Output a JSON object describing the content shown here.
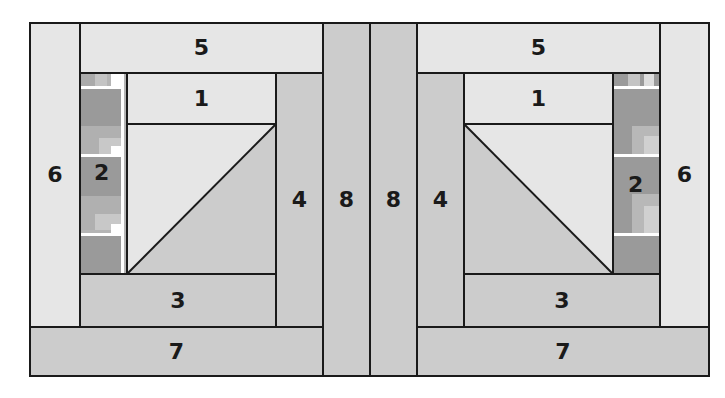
{
  "diagram": {
    "colors": {
      "light": "#e6e6e6",
      "medium": "#cccccc",
      "dark_strip": "#9a9a9a",
      "seam": "#1a1a1a",
      "highlight": "#ffffff"
    },
    "left_block": {
      "pieces": {
        "p1": "1",
        "p2": "2",
        "p3": "3",
        "p4": "4",
        "p5": "5",
        "p6": "6",
        "p7": "7",
        "p8": "8"
      }
    },
    "right_block": {
      "pieces": {
        "p1": "1",
        "p2": "2",
        "p3": "3",
        "p4": "4",
        "p5": "5",
        "p6": "6",
        "p7": "7",
        "p8": "8"
      }
    }
  }
}
